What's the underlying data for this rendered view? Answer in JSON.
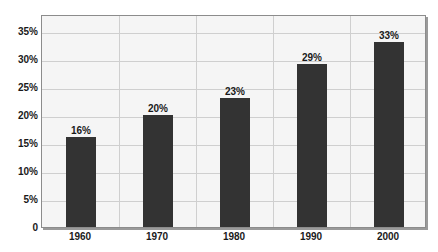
{
  "chart_data": {
    "type": "bar",
    "title": "",
    "xlabel": "",
    "ylabel": "",
    "categories": [
      "1960",
      "1970",
      "1980",
      "1990",
      "2000"
    ],
    "values": [
      16,
      20,
      23,
      29,
      33
    ],
    "value_labels": [
      "16%",
      "20%",
      "23%",
      "29%",
      "33%"
    ],
    "ylim": [
      0,
      38
    ],
    "ytick_values": [
      0,
      5,
      10,
      15,
      20,
      25,
      30,
      35
    ],
    "ytick_labels": [
      "0",
      "5%",
      "10%",
      "15%",
      "20%",
      "25%",
      "30%",
      "35%"
    ],
    "grid": "both",
    "legend": "none",
    "series": [
      {
        "name": "Percent",
        "values": [
          16,
          20,
          23,
          29,
          33
        ]
      }
    ]
  },
  "style": {
    "bar_color": "#333333",
    "plot_background": "#f5f5f5",
    "grid_color": "#cfcfcf",
    "frame_color": "#8c8c8c",
    "text_color": "#1a1a1a",
    "page_background": "#ffffff"
  },
  "title_strip": {
    "text": ""
  }
}
